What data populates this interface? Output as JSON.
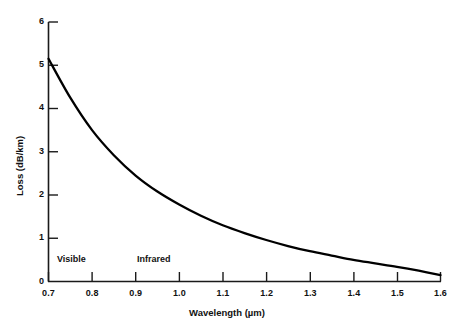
{
  "chart_data": {
    "type": "line",
    "title": "",
    "xlabel": "Wavelength (µm)",
    "ylabel": "Loss (dB/km)",
    "xlim": [
      0.7,
      1.6
    ],
    "ylim": [
      0,
      6
    ],
    "grid": false,
    "legend": "none",
    "xticks": [
      "0.7",
      "0.8",
      "0.9",
      "1.0",
      "1.1",
      "1.2",
      "1.3",
      "1.4",
      "1.5",
      "1.6"
    ],
    "xtick_values": [
      0.7,
      0.8,
      0.9,
      1.0,
      1.1,
      1.2,
      1.3,
      1.4,
      1.5,
      1.6
    ],
    "yticks": [
      "0",
      "1",
      "2",
      "3",
      "4",
      "5",
      "6"
    ],
    "ytick_values": [
      0,
      1,
      2,
      3,
      4,
      5,
      6
    ],
    "x": [
      0.7,
      0.75,
      0.8,
      0.85,
      0.9,
      0.95,
      1.0,
      1.05,
      1.1,
      1.15,
      1.2,
      1.25,
      1.3,
      1.35,
      1.4,
      1.45,
      1.5,
      1.55,
      1.6
    ],
    "values": [
      5.15,
      4.25,
      3.5,
      2.92,
      2.45,
      2.08,
      1.78,
      1.52,
      1.3,
      1.12,
      0.96,
      0.82,
      0.7,
      0.6,
      0.5,
      0.42,
      0.34,
      0.25,
      0.15
    ],
    "series": [
      {
        "name": "Fiber attenuation",
        "values": [
          5.15,
          4.25,
          3.5,
          2.92,
          2.45,
          2.08,
          1.78,
          1.52,
          1.3,
          1.12,
          0.96,
          0.82,
          0.7,
          0.6,
          0.5,
          0.42,
          0.34,
          0.25,
          0.15
        ],
        "color": "#000000"
      }
    ],
    "annotations": [
      {
        "text": "Visible",
        "x": 0.74,
        "y": 0.52
      },
      {
        "text": "Infrared",
        "x": 0.92,
        "y": 0.52
      }
    ]
  },
  "axes": {
    "x_title": "Wavelength (µm)",
    "y_title": "Loss (dB/km)"
  },
  "xticks": [
    {
      "label": "0.7"
    },
    {
      "label": "0.8"
    },
    {
      "label": "0.9"
    },
    {
      "label": "1.0"
    },
    {
      "label": "1.1"
    },
    {
      "label": "1.2"
    },
    {
      "label": "1.3"
    },
    {
      "label": "1.4"
    },
    {
      "label": "1.5"
    },
    {
      "label": "1.6"
    }
  ],
  "yticks": [
    {
      "label": "6"
    },
    {
      "label": "5"
    },
    {
      "label": "4"
    },
    {
      "label": "3"
    },
    {
      "label": "2"
    },
    {
      "label": "1"
    },
    {
      "label": "0"
    }
  ],
  "regions": [
    {
      "label": "Visible"
    },
    {
      "label": "Infrared"
    }
  ],
  "colors": {
    "curve": "#000000",
    "axis": "#1a1a1a",
    "background": "#ffffff"
  }
}
